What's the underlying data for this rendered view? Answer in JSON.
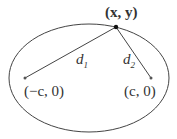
{
  "diagram": {
    "type": "ellipse-foci",
    "point_label": "(x, y)",
    "focus_left_label": "(−c, 0)",
    "focus_right_label": "(c, 0)",
    "distance_1_label": "d",
    "distance_1_sub": "1",
    "distance_2_label": "d",
    "distance_2_sub": "2",
    "stroke_color": "#333333"
  }
}
